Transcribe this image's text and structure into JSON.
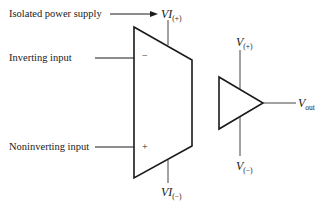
{
  "labels": {
    "isolated_power_supply": "Isolated power supply",
    "inverting_input": "Inverting input",
    "noninverting_input": "Noninverting input"
  },
  "isolation_amp": {
    "supply_pos": {
      "main": "VI",
      "sub": "(+)"
    },
    "supply_neg": {
      "main": "VI",
      "sub": "(−)"
    },
    "minus_sign": "−",
    "plus_sign": "+"
  },
  "output_amp": {
    "supply_pos": {
      "main": "V",
      "sub": "(+)"
    },
    "supply_neg": {
      "main": "V",
      "sub": "(−)"
    },
    "output": {
      "main": "V",
      "sub": "out"
    }
  },
  "colors": {
    "line": "#1a1a1a",
    "lead": "#444444"
  }
}
